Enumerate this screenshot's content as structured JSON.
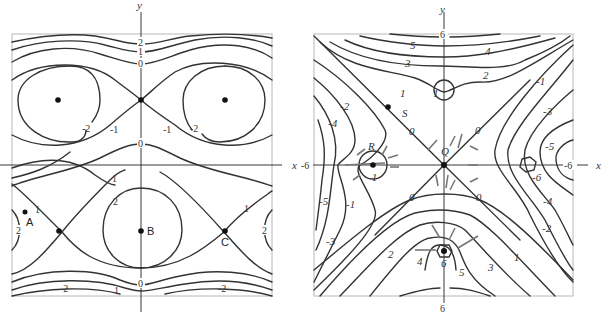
{
  "left_plot": {
    "axis_labels": {
      "x": "x",
      "y": "y"
    },
    "contour_labels": {
      "top": [
        "2",
        "1",
        "0"
      ],
      "upper_left": [
        "-2",
        "-1"
      ],
      "upper_right": [
        "-1",
        "-2"
      ],
      "middle_zero": "0",
      "lower_left_one": "1",
      "lower_center_two": "2",
      "lower_right_one": "1",
      "left_edge_two": "2",
      "right_edge_two": "2",
      "bottom": [
        "-2",
        "1",
        "0",
        "-2"
      ],
      "a_one": "1"
    },
    "points": [
      {
        "name": "A",
        "label": "A"
      },
      {
        "name": "B",
        "label": "B"
      },
      {
        "name": "C",
        "label": "C"
      }
    ]
  },
  "right_plot": {
    "axis_labels": {
      "x": "x",
      "y": "y"
    },
    "axis_ticks": {
      "left": "-6",
      "right": "-6",
      "top": "6",
      "bottom": "6"
    },
    "contour_labels": {
      "top": [
        "5",
        "4",
        "3",
        "2",
        "1"
      ],
      "center_ring": "1",
      "left": [
        "-2",
        "-4",
        "-5",
        "-3",
        "-1"
      ],
      "right": [
        "-1",
        "-3",
        "-5",
        "-6",
        "-4",
        "-2"
      ],
      "zeros": [
        "0",
        "0",
        "0",
        "0"
      ],
      "bottom": [
        "2",
        "4",
        "6",
        "5",
        "3",
        "1"
      ],
      "r_minus_one": "-1"
    },
    "points": [
      {
        "name": "S",
        "label": "S"
      },
      {
        "name": "R",
        "label": "R"
      },
      {
        "name": "Q",
        "label": "Q"
      }
    ]
  }
}
